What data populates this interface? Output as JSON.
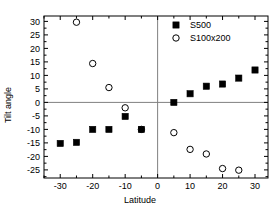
{
  "chart_data": {
    "type": "scatter",
    "title": "",
    "xlabel": "Latitude",
    "ylabel": "Tilt angle",
    "xlim": [
      -35,
      34
    ],
    "ylim": [
      -28,
      32
    ],
    "xticks": [
      -30,
      -20,
      -10,
      0,
      10,
      20,
      30
    ],
    "xtick_labels": [
      "-30",
      "-20",
      "-10",
      "0",
      "10",
      "20",
      "30"
    ],
    "yticks": [
      30,
      25,
      20,
      15,
      10,
      5,
      0,
      -5,
      -10,
      -15,
      -20,
      -25
    ],
    "ytick_labels": [
      "30",
      "25",
      "20",
      "15",
      "10",
      "5",
      "0",
      "-5",
      "-10",
      "-15",
      "-20",
      "-25"
    ],
    "grid": false,
    "legend_position": "top-right",
    "zero_lines": {
      "horizontal_y": 0,
      "vertical_x": 0,
      "color": "#808080"
    },
    "series": [
      {
        "name": "S500",
        "marker": "filled-square",
        "color": "#000000",
        "points": [
          {
            "x": -30,
            "y": -15.2
          },
          {
            "x": -25,
            "y": -14.8
          },
          {
            "x": -20,
            "y": -10.0
          },
          {
            "x": -15,
            "y": -10.0
          },
          {
            "x": -10,
            "y": -5.2
          },
          {
            "x": -5,
            "y": -10.0
          },
          {
            "x": 5,
            "y": 0.0
          },
          {
            "x": 10,
            "y": 3.2
          },
          {
            "x": 15,
            "y": 6.0
          },
          {
            "x": 20,
            "y": 6.8
          },
          {
            "x": 25,
            "y": 9.0
          },
          {
            "x": 30,
            "y": 12.0
          }
        ]
      },
      {
        "name": "S100x200",
        "marker": "open-circle",
        "color": "#000000",
        "points": [
          {
            "x": -25,
            "y": 29.7
          },
          {
            "x": -20,
            "y": 14.4
          },
          {
            "x": -15,
            "y": 5.5
          },
          {
            "x": -10,
            "y": -2.0
          },
          {
            "x": -5,
            "y": -10.0
          },
          {
            "x": 5,
            "y": -11.2
          },
          {
            "x": 10,
            "y": -17.4
          },
          {
            "x": 15,
            "y": -19.1
          },
          {
            "x": 20,
            "y": -24.5
          },
          {
            "x": 25,
            "y": -25.1
          }
        ]
      }
    ],
    "legend": [
      {
        "label": "S500",
        "marker": "filled-square"
      },
      {
        "label": "S100x200",
        "marker": "open-circle"
      }
    ]
  }
}
